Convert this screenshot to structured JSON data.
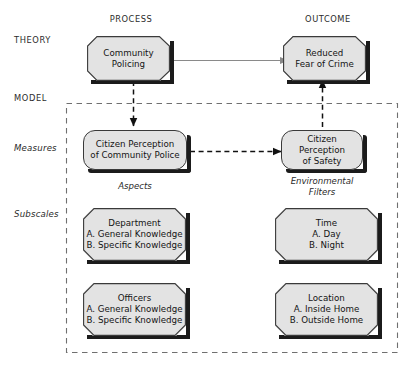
{
  "diagram": {
    "column_headers": [
      {
        "id": "process",
        "label": "PROCESS"
      },
      {
        "id": "outcome",
        "label": "OUTCOME"
      }
    ],
    "row_labels": [
      {
        "id": "theory",
        "label": "THEORY",
        "style": "caps"
      },
      {
        "id": "model",
        "label": "MODEL",
        "style": "caps"
      },
      {
        "id": "measures",
        "label": "Measures",
        "style": "italic"
      },
      {
        "id": "subscales",
        "label": "Subscales",
        "style": "italic"
      }
    ],
    "group_labels": [
      {
        "id": "aspects",
        "label": "Aspects"
      },
      {
        "id": "environmental-filters",
        "label": "Environmental\nFilters"
      }
    ],
    "nodes": {
      "community_policing": "Community\nPolicing",
      "reduced_fear_of_crime": "Reduced\nFear of Crime",
      "citizen_perception_community_police": "Citizen Perception\nof Community Police",
      "citizen_perception_safety": "Citizen Perception\nof Safety",
      "department": "Department\nA. General Knowledge\nB. Specific Knowledge",
      "officers": "Officers\nA. General Knowledge\nB. Specific Knowledge",
      "time": "Time\nA. Day\nB. Night",
      "location": "Location\nA. Inside Home\nB. Outside Home"
    },
    "connectors": [
      {
        "id": "theory-process-to-outcome",
        "from": "community_policing",
        "to": "reduced_fear_of_crime",
        "style": "solid",
        "color": "#8a8a8a",
        "direction": "right"
      },
      {
        "id": "process-theory-to-measure",
        "from": "community_policing",
        "to": "citizen_perception_community_police",
        "style": "dashed",
        "color": "#111111",
        "direction": "down"
      },
      {
        "id": "measure-process-to-outcome",
        "from": "citizen_perception_community_police",
        "to": "citizen_perception_safety",
        "style": "dashed",
        "color": "#111111",
        "direction": "right"
      },
      {
        "id": "outcome-measure-to-theory",
        "from": "citizen_perception_safety",
        "to": "reduced_fear_of_crime",
        "style": "dashed",
        "color": "#111111",
        "direction": "up"
      }
    ],
    "model_boundary": {
      "id": "model-boundary",
      "style": "dashed"
    },
    "colors": {
      "node_fill": "#e3e3e3",
      "node_stroke": "#3a3a3a",
      "node_shadow": "#1b1b1b",
      "solid_arrow": "#8a8a8a",
      "dashed_arrow": "#111111",
      "boundary": "#6f6f6f",
      "text": "#141414",
      "background": "#ffffff"
    }
  }
}
